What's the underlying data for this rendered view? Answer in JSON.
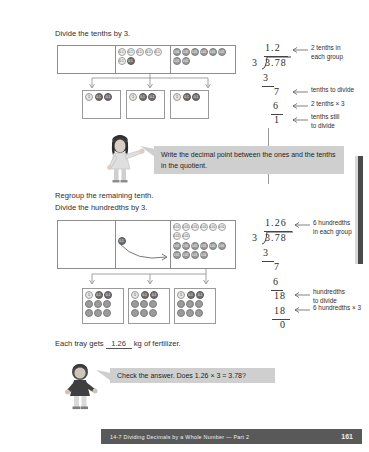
{
  "page": {
    "footer_title": "14-7  Dividing Decimals by a Whole Number — Part 2",
    "footer_page": "161",
    "accent_dark": "#595959",
    "callout_bg": "#cfcfcf"
  },
  "step1": {
    "instruction": "Divide the tenths by 3.",
    "chart": {
      "ones_label": "",
      "tenths": [
        "0.1",
        "0.1",
        "0.1",
        "0.1",
        "0.1",
        "0.1",
        "0.1"
      ],
      "hundredths": [
        "0.01",
        "0.01",
        "0.01",
        "0.01",
        "0.01",
        "0.01",
        "0.01",
        "0.01"
      ]
    },
    "groups": [
      {
        "one": "1",
        "tenths": [
          "0.1",
          "0.1"
        ]
      },
      {
        "one": "1",
        "tenths": [
          "0.1",
          "0.1"
        ]
      },
      {
        "one": "1",
        "tenths": [
          "0.1",
          "0.1"
        ]
      }
    ],
    "division": {
      "quotient": "1.2",
      "divisor": "3",
      "dividend": "3.78",
      "rows": [
        "3",
        "7",
        "6",
        "1"
      ]
    },
    "annotations": [
      "2 tenths in",
      "each group",
      "tenths to divide",
      "2 tenths × 3",
      "tenths still",
      "to divide"
    ],
    "callout": "Write the decimal point between the ones and the tenths in the quotient."
  },
  "step2": {
    "instruction_line1": "Regroup the remaining tenth.",
    "instruction_line2": "Divide the hundredths by 3.",
    "chart": {
      "regrouped_tenth": "0.1",
      "hundredths": [
        "0.01",
        "0.01",
        "0.01",
        "0.01",
        "0.01",
        "0.01",
        "0.01",
        "0.01",
        "0.01",
        "0.01",
        "0.01",
        "0.01",
        "0.01",
        "0.01",
        "0.01",
        "0.01",
        "0.01",
        "0.01"
      ]
    },
    "groups": [
      {
        "one": "1",
        "tenths": [
          "0.1",
          "0.1"
        ],
        "hundredths_count": 6
      },
      {
        "one": "1",
        "tenths": [
          "0.1",
          "0.1"
        ],
        "hundredths_count": 6
      },
      {
        "one": "1",
        "tenths": [
          "0.1",
          "0.1"
        ],
        "hundredths_count": 6
      }
    ],
    "division": {
      "quotient": "1.26",
      "divisor": "3",
      "dividend": "3.78",
      "rows": [
        "3",
        "7",
        "6",
        "18",
        "18",
        "0"
      ]
    },
    "annotations": [
      "6 hundredths",
      "in each group",
      "hundredths",
      "to divide",
      "6 hundredths × 3"
    ]
  },
  "answer": {
    "prefix": "Each tray gets",
    "value": "1.26",
    "suffix": "kg of fertilizer."
  },
  "check": {
    "callout": "Check the answer. Does 1.26 × 3 = 3.78?"
  }
}
